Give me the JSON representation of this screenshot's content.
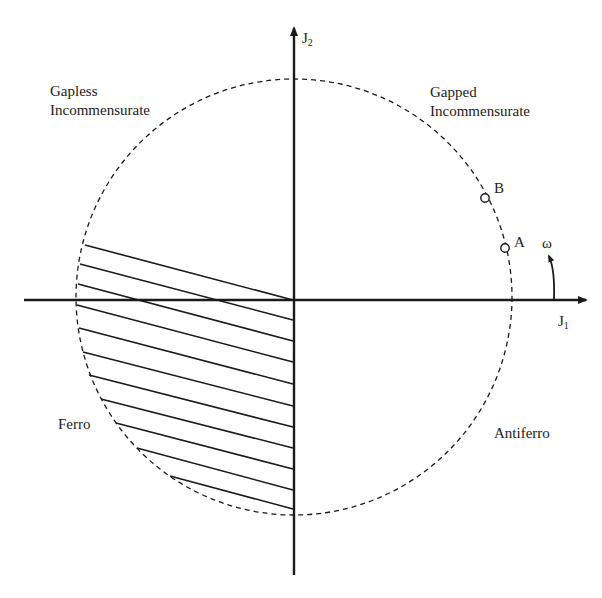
{
  "diagram": {
    "type": "phase-diagram",
    "axes": {
      "x_label": "J",
      "x_subscript": "1",
      "y_label": "J",
      "y_subscript": "2"
    },
    "angle_label": "ω",
    "regions": {
      "top_left": [
        "Gapless",
        "Incommensurate"
      ],
      "top_right": [
        "Gapped",
        "Incommensurate"
      ],
      "bottom_left": "Ferro",
      "bottom_right": "Antiferro"
    },
    "points": [
      {
        "name": "A"
      },
      {
        "name": "B"
      }
    ],
    "colors": {
      "line": "#1a1a1a",
      "background": "#ffffff"
    }
  }
}
